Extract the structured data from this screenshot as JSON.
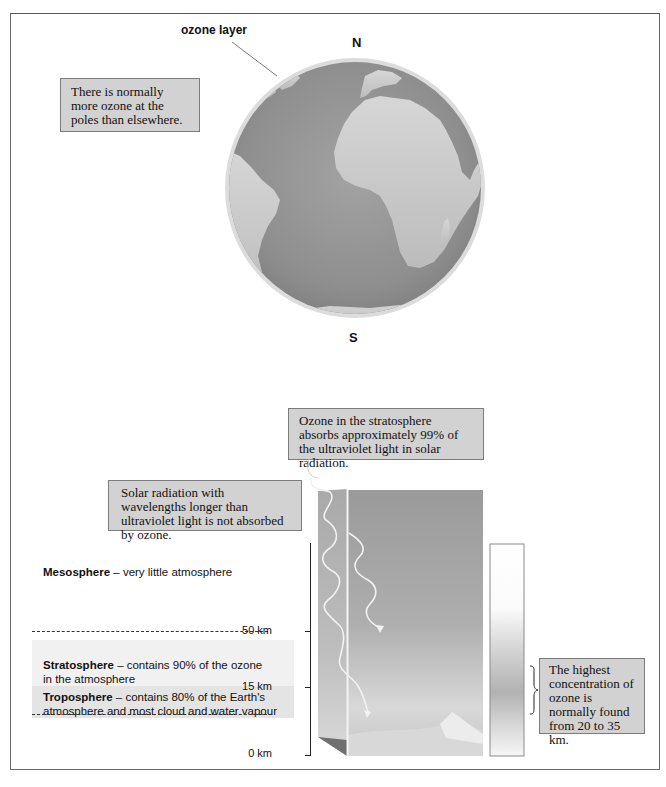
{
  "globe": {
    "label_ozone_layer": "ozone layer",
    "label_north": "N",
    "label_south": "S",
    "callout": "There is normally more ozone at the poles than elsewhere."
  },
  "atmosphere": {
    "callout_uv": "Ozone in the stratosphere absorbs approximately 99% of the ultraviolet light in solar radiation.",
    "callout_longer": "Solar radiation with wavelengths longer than ultraviolet light is not absorbed by ozone.",
    "callout_concentration": "The highest concentration of ozone is normally found from 20 to 35 km.",
    "layers": [
      {
        "name": "Mesosphere",
        "description": " – very little atmosphere"
      },
      {
        "name": "Stratosphere",
        "description": " – contains 90% of the ozone in the atmosphere"
      },
      {
        "name": "Troposphere",
        "description": " – contains 80% of the Earth's atmosphere and most cloud and water vapour"
      }
    ],
    "altitudes": {
      "top_boundary": "50 km",
      "lower_boundary": "15 km",
      "ground": "0 km"
    }
  },
  "colors": {
    "callout_bg": "#d2d2d2",
    "globe_ocean": "#8f8f8f",
    "globe_land": "#c9c9c9",
    "layer_meso": "#ffffff",
    "layer_strato": "#f1f1f1",
    "layer_tropo": "#e4e4e4"
  }
}
